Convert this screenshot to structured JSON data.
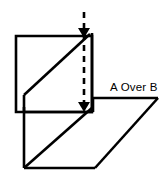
{
  "figure": {
    "title": "A Over B",
    "background_color": "#ffffff",
    "line_color": "#000000",
    "width": 167,
    "height": 176,
    "annotation": {
      "label": "A Over B",
      "x": 110,
      "y": 91
    },
    "shapes": {
      "plane_a": {
        "name": "plane-a-square",
        "description": "upper square outline",
        "points": "16,36 92,36 92,112 16,112"
      },
      "plane_a_diagonal": {
        "name": "plane-a-diagonal",
        "description": "diagonal fold line across upper square",
        "points": "24,95 88,36"
      },
      "plane_a_left_edge": {
        "name": "plane-a-left-edge",
        "description": "short vertical from diagonal to square bottom",
        "points": "24,95 24,112"
      },
      "plane_b": {
        "name": "plane-b-parallelogram",
        "description": "lower parallelogram outline",
        "points": "24,107 93,107 158,98 95,168 24,168"
      },
      "plane_b_diagonal": {
        "name": "plane-b-diagonal",
        "description": "diagonal fold line across lower parallelogram",
        "points": "24,168 93,107"
      },
      "plane_b_right_edge": {
        "name": "plane-b-right-edge",
        "description": "right slanted edge of lower parallelogram",
        "points": "158,98 95,168"
      },
      "plane_b_bottom_edge": {
        "name": "plane-b-bottom-edge",
        "description": "bottom horizontal edge",
        "points": "24,168 95,168"
      },
      "depth_axis": {
        "name": "depth-axis-dashed-line",
        "description": "vertical dashed line with arrowheads at both ends",
        "x": 84,
        "y_top": 12,
        "y_bottom": 112,
        "style": "dashed",
        "arrow_top": true,
        "arrow_bottom": true
      },
      "riser_right": {
        "name": "riser-right-vertical",
        "description": "vertical connector on right side between planes",
        "points": "92,33 92,112"
      }
    }
  }
}
